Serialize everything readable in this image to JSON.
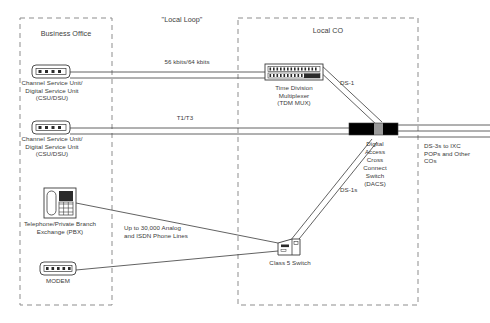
{
  "diagram": {
    "zones": [
      {
        "id": "business-office",
        "label": "Business Office",
        "x": 20,
        "y": 18,
        "w": 92,
        "h": 287
      },
      {
        "id": "local-loop",
        "label": "\"Local Loop\""
      },
      {
        "id": "local-co",
        "label": "Local CO",
        "x": 238,
        "y": 18,
        "w": 180,
        "h": 287
      }
    ],
    "devices": [
      {
        "id": "csu-dsu-1",
        "icon": "csu-dsu-icon",
        "label": "Channel Service Unit/\nDigital Service Unit\n(CSU/DSU)"
      },
      {
        "id": "csu-dsu-2",
        "icon": "csu-dsu-icon",
        "label": "Channel Service Unit/\nDigital Service Unit\n(CSU/DSU)"
      },
      {
        "id": "pbx",
        "icon": "telephone-pbx-icon",
        "label": "Telephone/Private Branch\nExchange (PBX)"
      },
      {
        "id": "modem",
        "icon": "modem-icon",
        "label": "MODEM"
      },
      {
        "id": "tdm-mux",
        "icon": "tdm-mux-icon",
        "label": "Time Division\nMultiplexer\n(TDM MUX)"
      },
      {
        "id": "dacs",
        "icon": "dacs-switch-icon",
        "label": "Digital\nAccess\nCross\nConnect\nSwitch\n(DACS)"
      },
      {
        "id": "class5",
        "icon": "class-5-switch-icon",
        "label": "Class 5 Switch"
      }
    ],
    "links": [
      {
        "id": "link-56-64",
        "label": "56 kbits/64 kbits"
      },
      {
        "id": "link-t1-t3",
        "label": "T1/T3"
      },
      {
        "id": "link-ds1",
        "label": "DS-1"
      },
      {
        "id": "link-ds1s",
        "label": "DS-1s"
      },
      {
        "id": "link-analog-isdn",
        "label": "Up to 30,000 Analog\nand ISDN Phone Lines"
      },
      {
        "id": "link-ds3",
        "label": "DS-3s to IXC\nPOPs and Other\nCOs"
      }
    ],
    "colors": {
      "line": "#3a3a3a",
      "dashed_border": "#8d8d8d",
      "text": "#3a3a3a",
      "device_fill": "#ffffff",
      "dacs_fill": "#000000",
      "dacs_mid": "#9a9a9a"
    }
  }
}
